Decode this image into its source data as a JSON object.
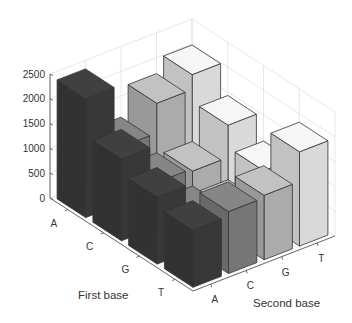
{
  "chart_data": {
    "type": "bar3d",
    "title": "",
    "xlabel": "Second base",
    "ylabel": "First base",
    "zlabel": "",
    "x_categories": [
      "A",
      "C",
      "G",
      "T"
    ],
    "y_categories": [
      "A",
      "C",
      "G",
      "T"
    ],
    "z_ticks": [
      0,
      500,
      1000,
      1500,
      2000,
      2500
    ],
    "zlim": [
      0,
      2500
    ],
    "grid": true,
    "series": [
      {
        "name": "A",
        "color": "#3b3b3b",
        "values": [
          2400,
          1650,
          1350,
          1150
        ]
      },
      {
        "name": "C",
        "color": "#7c7c7c",
        "values": [
          1150,
          900,
          700,
          1250
        ]
      },
      {
        "name": "G",
        "color": "#b4b4b4",
        "values": [
          1750,
          850,
          550,
          1300
        ]
      },
      {
        "name": "T",
        "color": "#e4e4e4",
        "values": [
          2050,
          1500,
          1050,
          1900
        ]
      }
    ],
    "note": "series = second base (color); values indexed by first base A,C,G,T"
  },
  "labels": {
    "first_base": "First base",
    "second_base": "Second base",
    "z_ticks": [
      "0",
      "500",
      "1000",
      "1500",
      "2000",
      "2500"
    ],
    "first_ticks": [
      "A",
      "C",
      "G",
      "T"
    ],
    "second_ticks": [
      "A",
      "C",
      "G",
      "T"
    ]
  }
}
